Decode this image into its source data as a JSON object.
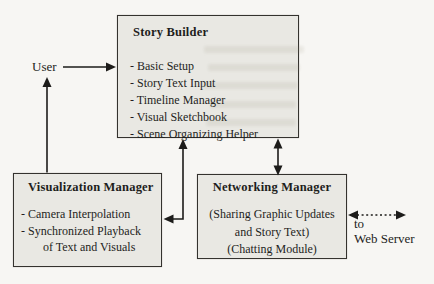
{
  "user": {
    "label": "User"
  },
  "web_server": {
    "lines": [
      "to",
      "Web Server"
    ]
  },
  "story_builder": {
    "title": "Story Builder",
    "items": [
      "- Basic Setup",
      "- Story Text Input",
      "- Timeline Manager",
      "- Visual Sketchbook",
      "- Scene Organizing Helper"
    ]
  },
  "visualization_manager": {
    "title": "Visualization Manager",
    "lines": [
      "- Camera Interpolation",
      "- Synchronized Playback",
      "of Text and Visuals"
    ]
  },
  "networking_manager": {
    "title": "Networking Manager",
    "lines": [
      "(Sharing Graphic Updates",
      "and Story Text)",
      "(Chatting Module)"
    ]
  },
  "connections": [
    {
      "from": "User",
      "to": "Story Builder",
      "style": "solid",
      "direction": "one-way"
    },
    {
      "from": "Visualization Manager",
      "to": "User",
      "style": "solid",
      "direction": "one-way"
    },
    {
      "from": "Story Builder",
      "to": "Visualization Manager",
      "style": "solid",
      "direction": "two-way"
    },
    {
      "from": "Story Builder",
      "to": "Networking Manager",
      "style": "solid",
      "direction": "two-way"
    },
    {
      "from": "Networking Manager",
      "to": "Web Server",
      "style": "dotted",
      "direction": "two-way"
    }
  ],
  "colors": {
    "background": "#f7f6f3",
    "box_fill": "#e9e8e3",
    "border": "#34322e",
    "text": "#1e1e1c",
    "arrow": "#1d1c1a"
  }
}
